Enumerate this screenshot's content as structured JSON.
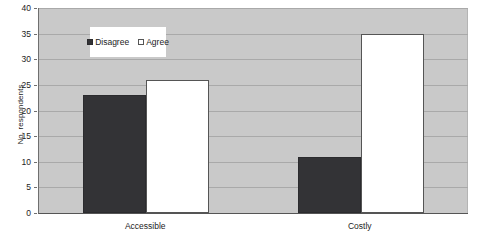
{
  "chart_data": {
    "type": "bar",
    "title": "",
    "subtitle": "",
    "xlabel": "",
    "ylabel": "No. respondents",
    "categories": [
      "Accessible",
      "Costly"
    ],
    "series": [
      {
        "name": "Disagree",
        "color": "#333336",
        "values": [
          23,
          11
        ]
      },
      {
        "name": "Agree",
        "color": "#ffffff",
        "values": [
          26,
          35
        ]
      }
    ],
    "ylim": [
      0,
      40
    ],
    "ytick_step": 5,
    "ytick_labels": [
      "0",
      "5",
      "10",
      "15",
      "20",
      "25",
      "30",
      "35",
      "40"
    ],
    "grid": true,
    "grid_axis": "y",
    "legend_position": "top-left-inside",
    "plot_background": "#c9c9c9",
    "page_background": "#ffffff"
  }
}
